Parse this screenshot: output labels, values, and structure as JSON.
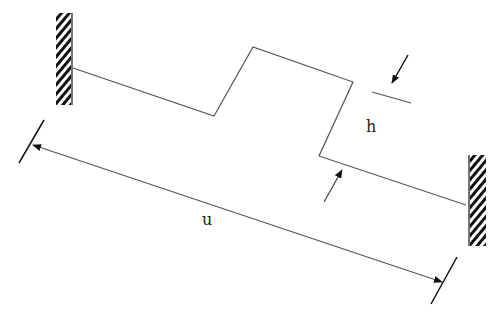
{
  "diagram": {
    "labels": {
      "h": "h",
      "u": "u"
    },
    "colors": {
      "line": "#555555",
      "arrow": "#111111",
      "hatch": "#111111",
      "background": "#ffffff"
    },
    "walls": [
      {
        "name": "left-fixed-support",
        "x": 56,
        "y": 13,
        "width": 17,
        "height": 92,
        "edge": "right"
      },
      {
        "name": "right-fixed-support",
        "x": 468,
        "y": 155,
        "width": 18,
        "height": 91,
        "edge": "left"
      }
    ],
    "beam_points": [
      [
        75,
        68
      ],
      [
        214,
        116
      ],
      [
        253,
        47
      ],
      [
        353,
        82
      ],
      [
        319,
        156
      ],
      [
        464,
        205
      ]
    ],
    "dimension_u": {
      "start_tick": [
        [
          44,
          120
        ],
        [
          19,
          163
        ]
      ],
      "end_tick": [
        [
          457,
          257
        ],
        [
          431,
          304
        ]
      ],
      "from": [
        33,
        145
      ],
      "to": [
        440,
        281
      ]
    },
    "dimension_h": {
      "ref_line": [
        [
          372,
          92
        ],
        [
          411,
          103
        ]
      ],
      "arrow_top": {
        "from": [
          408,
          55
        ],
        "to": [
          392,
          83
        ]
      },
      "arrow_bottom": {
        "from": [
          324,
          202
        ],
        "to": [
          342,
          170
        ]
      }
    }
  }
}
